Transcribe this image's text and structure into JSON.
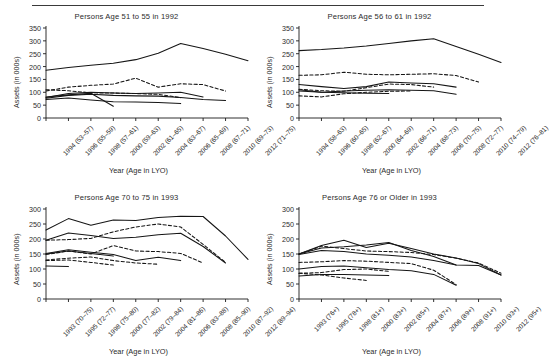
{
  "figure": {
    "top_rule": true,
    "panel_count": 4
  },
  "chart_data": [
    {
      "type": "line",
      "panel_index": 1,
      "title": "Persons Age 51 to 55 in 1992",
      "xlabel": "Year (Age in LYO)",
      "ylabel": "Assets (in 000s)",
      "ylim": [
        0,
        350
      ],
      "yticks": [
        0,
        50,
        100,
        150,
        200,
        250,
        300,
        350
      ],
      "grid": false,
      "legend": "none",
      "categories": [
        "1994 (53–57)",
        "1996 (55–59)",
        "1998 (57–61)",
        "2000 (59–63)",
        "2002 (61–65)",
        "2004 (63–67)",
        "2006 (65–69)",
        "2008 (67–71)",
        "2010 (69–73)",
        "2012 (71–75)"
      ],
      "series": [
        {
          "name": "solid-top",
          "style": "solid",
          "values": [
            186,
            196,
            205,
            213,
            227,
            252,
            290,
            270,
            248,
            223
          ]
        },
        {
          "name": "dashed-upper",
          "style": "dashed",
          "values": [
            105,
            120,
            127,
            132,
            155,
            120,
            133,
            130,
            105,
            null
          ]
        },
        {
          "name": "solid-mid-a",
          "style": "solid",
          "values": [
            80,
            95,
            100,
            97,
            95,
            97,
            100,
            82,
            null,
            null
          ]
        },
        {
          "name": "dashed-mid",
          "style": "dashed",
          "values": [
            110,
            106,
            98,
            97,
            95,
            92,
            79,
            null,
            null,
            null
          ]
        },
        {
          "name": "solid-mid-b",
          "style": "solid",
          "values": [
            77,
            88,
            92,
            88,
            86,
            85,
            80,
            72,
            68,
            null
          ]
        },
        {
          "name": "solid-low-a",
          "style": "solid",
          "values": [
            72,
            78,
            70,
            63,
            62,
            60,
            56,
            null,
            null,
            null
          ]
        },
        {
          "name": "solid-low-b",
          "style": "solid",
          "values": [
            82,
            90,
            96,
            46,
            null,
            null,
            null,
            null,
            null,
            null
          ]
        }
      ]
    },
    {
      "type": "line",
      "panel_index": 2,
      "title": "Persons Age 56 to 61 in 1992",
      "xlabel": "Year (Age in LYO)",
      "ylabel": "Assets (in 000s)",
      "ylim": [
        0,
        350
      ],
      "yticks": [
        0,
        50,
        100,
        150,
        200,
        250,
        300,
        350
      ],
      "grid": false,
      "legend": "none",
      "categories": [
        "1994 (58–63)",
        "1996 (60–65)",
        "1998 (62–67)",
        "2000 (64–69)",
        "2002 (66–71)",
        "2004 (68–73)",
        "2006 (70–75)",
        "2008 (72–77)",
        "2010 (74–79)",
        "2012 (76–81)"
      ],
      "series": [
        {
          "name": "solid-top",
          "style": "solid",
          "values": [
            262,
            266,
            272,
            280,
            290,
            300,
            308,
            278,
            248,
            216
          ]
        },
        {
          "name": "dashed-upper",
          "style": "dashed",
          "values": [
            166,
            168,
            178,
            170,
            168,
            170,
            172,
            165,
            140,
            null
          ]
        },
        {
          "name": "solid-mid-a",
          "style": "solid",
          "values": [
            130,
            122,
            115,
            122,
            140,
            136,
            133,
            120,
            null,
            null
          ]
        },
        {
          "name": "dashed-mid",
          "style": "dashed",
          "values": [
            112,
            106,
            104,
            118,
            132,
            130,
            120,
            null,
            null,
            null
          ]
        },
        {
          "name": "solid-mid-b",
          "style": "solid",
          "values": [
            110,
            100,
            105,
            108,
            110,
            108,
            106,
            92,
            null,
            null
          ]
        },
        {
          "name": "dashed-low",
          "style": "dashed",
          "values": [
            86,
            82,
            94,
            100,
            104,
            105,
            null,
            null,
            null,
            null
          ]
        },
        {
          "name": "solid-low",
          "style": "solid",
          "values": [
            105,
            100,
            98,
            96,
            95,
            null,
            null,
            null,
            null,
            null
          ]
        }
      ]
    },
    {
      "type": "line",
      "panel_index": 3,
      "title": "Persons Age 70 to 75 in 1993",
      "xlabel": "Year (Age in LYO)",
      "ylabel": "Assets (in 000s)",
      "ylim": [
        0,
        300
      ],
      "yticks": [
        0,
        50,
        100,
        150,
        200,
        250,
        300
      ],
      "grid": false,
      "legend": "none",
      "categories": [
        "1993 (70–75)",
        "1995 (72–77)",
        "1998 (75–80)",
        "2000 (77–82)",
        "2002 (79–84)",
        "2004 (81–86)",
        "2006 (83–88)",
        "2008 (85–90)",
        "2010 (87–92)",
        "2012 (89–94)"
      ],
      "series": [
        {
          "name": "solid-top",
          "style": "solid",
          "values": [
            230,
            268,
            246,
            263,
            262,
            272,
            276,
            275,
            210,
            132
          ]
        },
        {
          "name": "solid-second",
          "style": "solid",
          "values": [
            196,
            220,
            212,
            202,
            206,
            214,
            219,
            175,
            120,
            null
          ]
        },
        {
          "name": "dashed-upper",
          "style": "dashed",
          "values": [
            196,
            198,
            202,
            224,
            240,
            250,
            240,
            182,
            122,
            null
          ]
        },
        {
          "name": "solid-mid",
          "style": "solid",
          "values": [
            152,
            164,
            156,
            148,
            128,
            139,
            128,
            null,
            null,
            null
          ]
        },
        {
          "name": "dashed-mid",
          "style": "dashed",
          "values": [
            148,
            160,
            150,
            178,
            160,
            158,
            152,
            120,
            null,
            null
          ]
        },
        {
          "name": "dashed-low",
          "style": "dashed",
          "values": [
            130,
            136,
            140,
            128,
            120,
            116,
            null,
            null,
            null,
            null
          ]
        },
        {
          "name": "solid-low",
          "style": "solid",
          "values": [
            110,
            108,
            null,
            null,
            null,
            null,
            null,
            null,
            null,
            null
          ]
        },
        {
          "name": "solid-short",
          "style": "solid",
          "values": [
            150,
            160,
            152,
            143,
            null,
            null,
            null,
            null,
            null,
            null
          ]
        },
        {
          "name": "dashed-short",
          "style": "dashed",
          "values": [
            128,
            130,
            122,
            113,
            null,
            null,
            null,
            null,
            null,
            null
          ]
        }
      ]
    },
    {
      "type": "line",
      "panel_index": 4,
      "title": "Persons Age 76 or Older in 1993",
      "xlabel": "Year (Age in LYO)",
      "ylabel": "Assets (in 000s)",
      "ylim": [
        0,
        300
      ],
      "yticks": [
        0,
        50,
        100,
        150,
        200,
        250,
        300
      ],
      "grid": false,
      "legend": "none",
      "categories": [
        "1993 (76+)",
        "1995 (78+)",
        "1998 (81+)",
        "2000 (83+)",
        "2002 (85+)",
        "2004 (87+)",
        "2006 (89+)",
        "2008 (91+)",
        "2010 (93+)",
        "2012 (95+)"
      ],
      "series": [
        {
          "name": "solid-top",
          "style": "solid",
          "values": [
            150,
            178,
            196,
            172,
            186,
            168,
            150,
            137,
            118,
            80
          ]
        },
        {
          "name": "solid-second",
          "style": "solid",
          "values": [
            150,
            170,
            174,
            180,
            188,
            162,
            142,
            113,
            112,
            80
          ]
        },
        {
          "name": "dashed-upper",
          "style": "dashed",
          "values": [
            150,
            176,
            168,
            160,
            158,
            155,
            148,
            136,
            120,
            86
          ]
        },
        {
          "name": "solid-mid",
          "style": "solid",
          "values": [
            148,
            162,
            158,
            150,
            146,
            140,
            128,
            113,
            null,
            null
          ]
        },
        {
          "name": "dashed-mid",
          "style": "dashed",
          "values": [
            122,
            124,
            128,
            126,
            122,
            118,
            96,
            48,
            null,
            null
          ]
        },
        {
          "name": "solid-mid-b",
          "style": "solid",
          "values": [
            100,
            108,
            110,
            104,
            98,
            94,
            82,
            46,
            null,
            null
          ]
        },
        {
          "name": "dashed-low",
          "style": "dashed",
          "values": [
            86,
            88,
            98,
            100,
            92,
            null,
            null,
            null,
            null,
            null
          ]
        },
        {
          "name": "solid-low",
          "style": "solid",
          "values": [
            77,
            82,
            82,
            80,
            78,
            null,
            null,
            null,
            null,
            null
          ]
        },
        {
          "name": "dashed-short",
          "style": "dashed",
          "values": [
            86,
            80,
            70,
            62,
            null,
            null,
            null,
            null,
            null,
            null
          ]
        }
      ]
    }
  ],
  "style": {
    "line_color": "#151515",
    "axis_color": "#1a1a1a",
    "text_color": "#2b2b2b",
    "background": "#ffffff"
  }
}
